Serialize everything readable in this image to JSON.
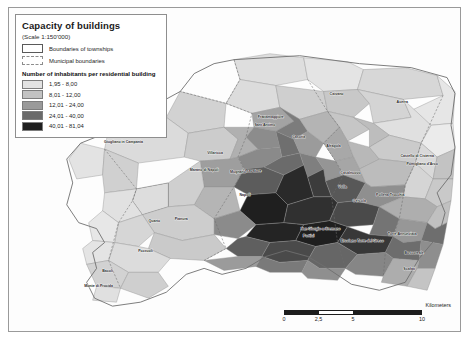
{
  "figure": {
    "kind": "choropleth-map",
    "region": "Metropolitan area of Naples, Campania, Italy"
  },
  "legend": {
    "title": "Capacity of buildings",
    "scale_note": "(Scale 1:150'000)",
    "boundary_items": [
      {
        "label": "Boundaries of townships",
        "style": "solid-outline",
        "fill": "#ffffff",
        "stroke": "#5a5a5a"
      },
      {
        "label": "Municipal boundaries",
        "style": "dashed-outline",
        "fill": "#ffffff",
        "stroke": "#8d8d8d"
      }
    ],
    "classes_heading": "Number of inhabitants per residential building",
    "classes": [
      {
        "label": "1,95 - 8,00",
        "color": "#e2e2e2"
      },
      {
        "label": "8,01 - 12,00",
        "color": "#c2c2c2"
      },
      {
        "label": "12,01 - 24,00",
        "color": "#9a9a9a"
      },
      {
        "label": "24,01 - 40,00",
        "color": "#6a6a6a"
      },
      {
        "label": "40,01 - 81,04",
        "color": "#1f1f1f"
      }
    ]
  },
  "scalebar": {
    "units": "Kilometers",
    "ticks": [
      "0",
      "2,5",
      "5",
      "10"
    ],
    "segments": [
      "dark",
      "light",
      "dark",
      "dark"
    ]
  },
  "chart_data": {
    "type": "map",
    "title": "Capacity of buildings",
    "variable": "Number of inhabitants per residential building",
    "class_breaks": [
      1.95,
      8.0,
      12.0,
      24.0,
      40.0,
      81.04
    ],
    "class_colors": [
      "#e2e2e2",
      "#c2c2c2",
      "#9a9a9a",
      "#6a6a6a",
      "#1f1f1f"
    ],
    "scale": "1:150'000",
    "legend_position": "top-left",
    "scalebar_position": "bottom-right",
    "place_labels": [
      {
        "name": "Caivano",
        "x": 338,
        "y": 96,
        "class": 2
      },
      {
        "name": "Acerra",
        "x": 404,
        "y": 104,
        "class": 1
      },
      {
        "name": "Frattamaggiore",
        "x": 272,
        "y": 119,
        "class": 3
      },
      {
        "name": "Sant'Antimo",
        "x": 266,
        "y": 127,
        "class": 3
      },
      {
        "name": "Casoria",
        "x": 300,
        "y": 139,
        "class": 4
      },
      {
        "name": "Afragola",
        "x": 335,
        "y": 148,
        "class": 3
      },
      {
        "name": "Giugliano in Campania",
        "x": 124,
        "y": 144,
        "class": 2
      },
      {
        "name": "Castello di Cisterna",
        "x": 419,
        "y": 158,
        "class": 2
      },
      {
        "name": "Pomigliano d'Arco",
        "x": 424,
        "y": 166,
        "class": 2
      },
      {
        "name": "Villaricca",
        "x": 216,
        "y": 155,
        "class": 2
      },
      {
        "name": "Marano di Napoli",
        "x": 205,
        "y": 172,
        "class": 3
      },
      {
        "name": "Casavatore",
        "x": 253,
        "y": 173,
        "class": 4
      },
      {
        "name": "Mugnano",
        "x": 239,
        "y": 174,
        "class": 3
      },
      {
        "name": "Casalnuovo",
        "x": 352,
        "y": 175,
        "class": 3
      },
      {
        "name": "Volla",
        "x": 344,
        "y": 189,
        "class": 2
      },
      {
        "name": "Napoli",
        "x": 246,
        "y": 197,
        "class": 5
      },
      {
        "name": "Pollena Trocchia",
        "x": 392,
        "y": 197,
        "class": 2
      },
      {
        "name": "Cercola",
        "x": 361,
        "y": 203,
        "class": 3
      },
      {
        "name": "San Giorgio a Cremano",
        "x": 322,
        "y": 231,
        "class": 4
      },
      {
        "name": "Torre del Greco",
        "x": 372,
        "y": 243,
        "class": 3
      },
      {
        "name": "Ercolano",
        "x": 350,
        "y": 243,
        "class": 3
      },
      {
        "name": "Portici",
        "x": 310,
        "y": 238,
        "class": 5
      },
      {
        "name": "Bacoli",
        "x": 108,
        "y": 274,
        "class": 2
      },
      {
        "name": "Monte di Procida",
        "x": 99,
        "y": 289,
        "class": 2
      },
      {
        "name": "Pozzuoli",
        "x": 146,
        "y": 254,
        "class": 2
      },
      {
        "name": "Boscoreale",
        "x": 416,
        "y": 256,
        "class": 2
      },
      {
        "name": "Torre Annunziata",
        "x": 404,
        "y": 236,
        "class": 4
      },
      {
        "name": "Scafati",
        "x": 411,
        "y": 272,
        "class": 2
      },
      {
        "name": "Quarto",
        "x": 155,
        "y": 223,
        "class": 2
      },
      {
        "name": "Pianura",
        "x": 182,
        "y": 221,
        "class": 3
      }
    ]
  }
}
